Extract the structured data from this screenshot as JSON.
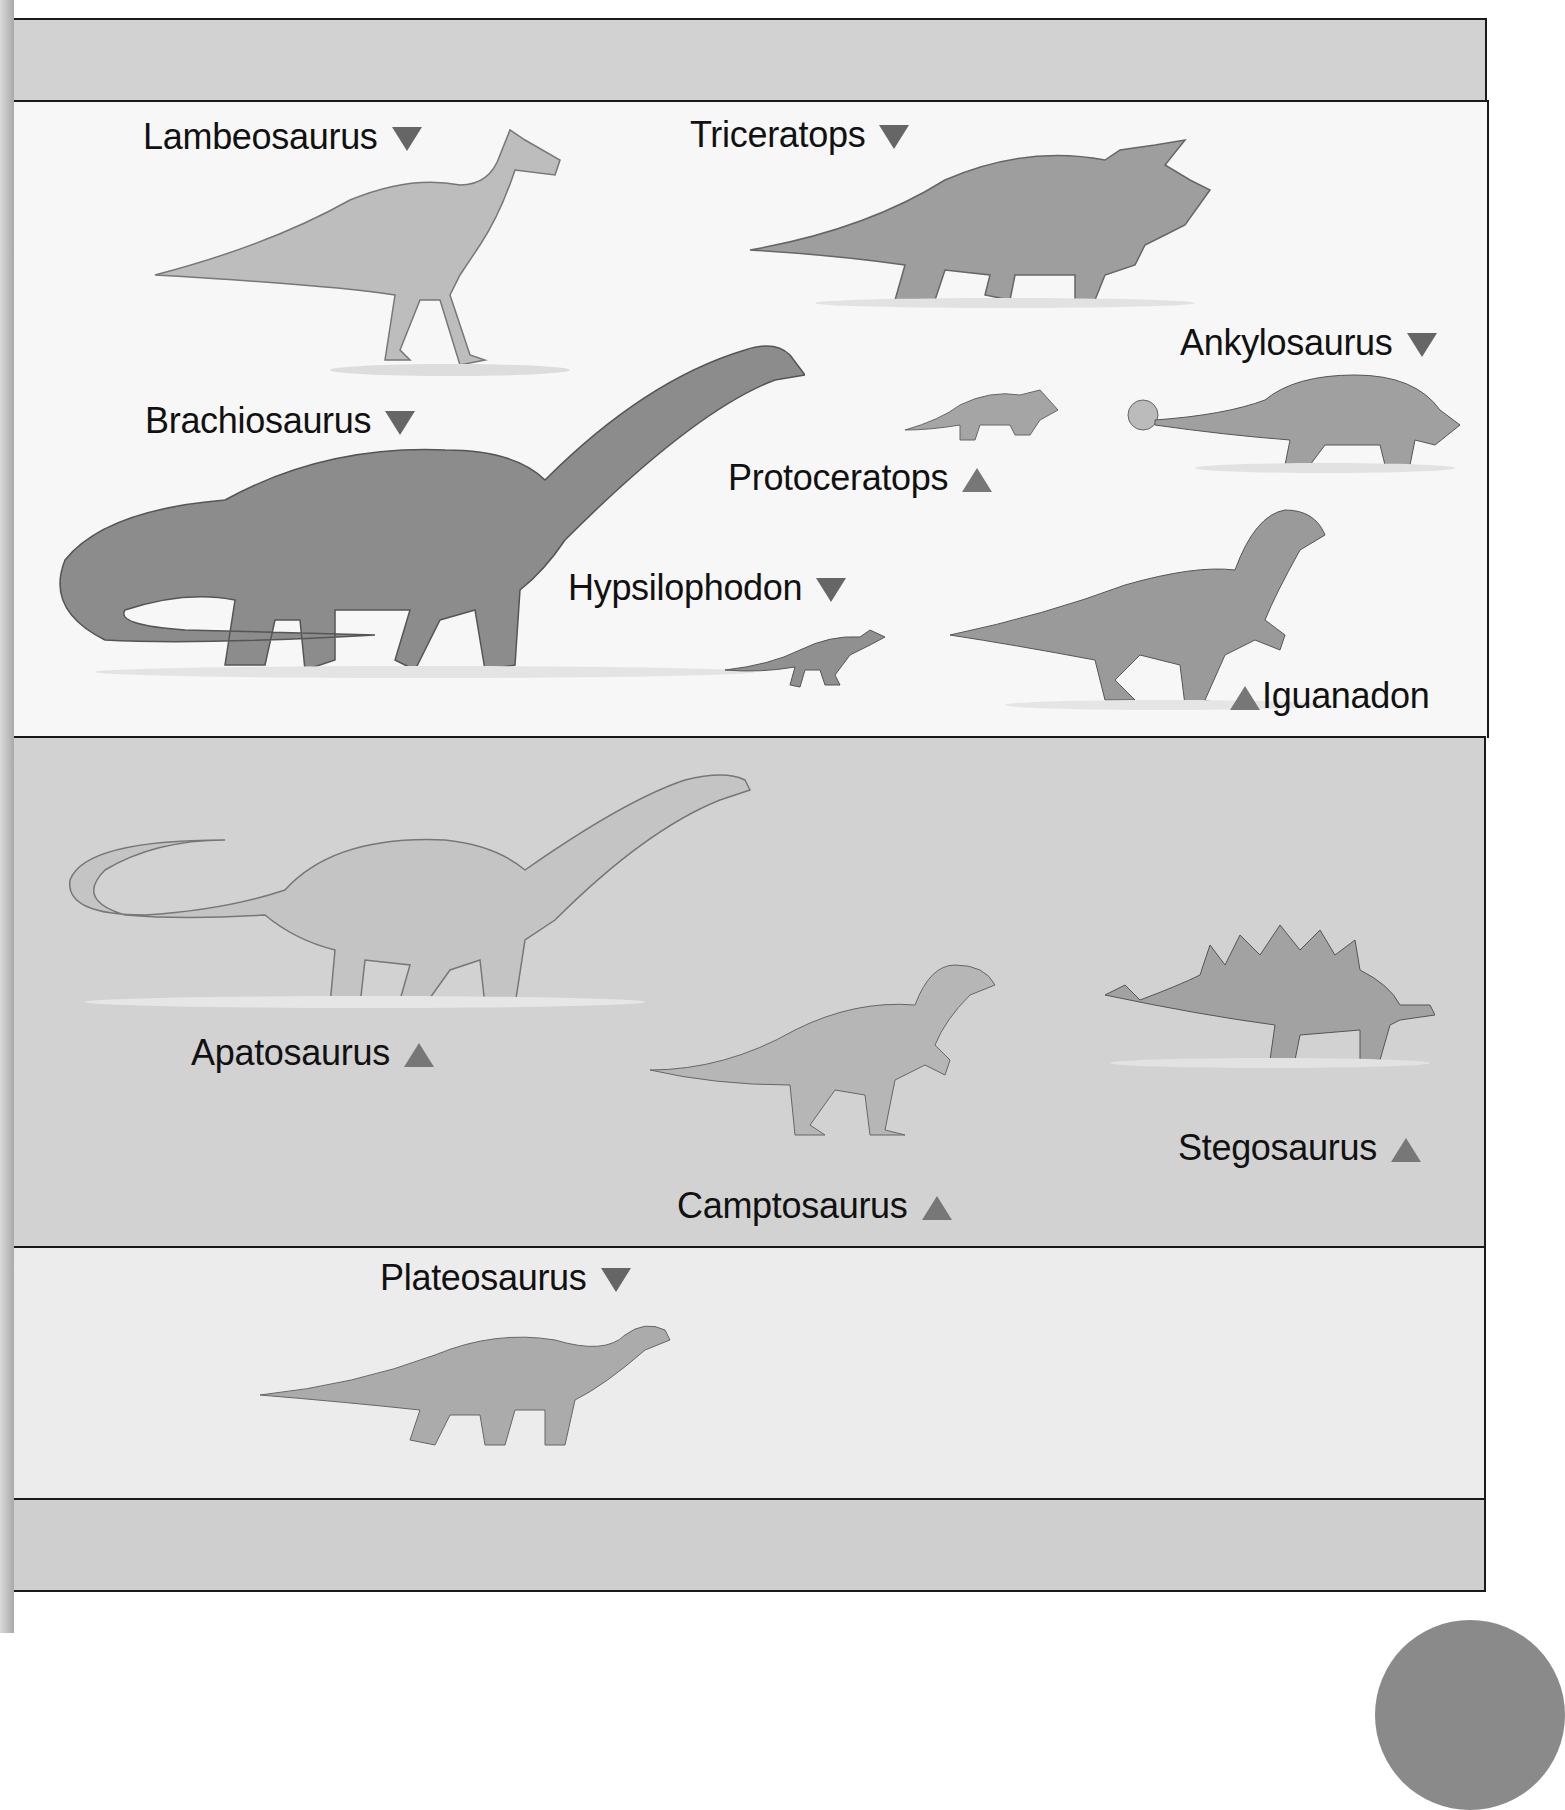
{
  "figure": {
    "bands": [
      {
        "name": "top-grey-band",
        "shade": "#d2d2d2"
      },
      {
        "name": "band-1",
        "shade": "#f7f7f7"
      },
      {
        "name": "band-2",
        "shade": "#cfcfcf"
      },
      {
        "name": "band-3",
        "shade": "#ececec"
      },
      {
        "name": "bottom-grey-band",
        "shade": "#cfcfcf"
      }
    ],
    "dinosaurs": [
      {
        "id": "lambeosaurus",
        "label": "Lambeosaurus",
        "marker": "down"
      },
      {
        "id": "triceratops",
        "label": "Triceratops",
        "marker": "down"
      },
      {
        "id": "ankylosaurus",
        "label": "Ankylosaurus",
        "marker": "down"
      },
      {
        "id": "brachiosaurus",
        "label": "Brachiosaurus",
        "marker": "down"
      },
      {
        "id": "protoceratops",
        "label": "Protoceratops",
        "marker": "up"
      },
      {
        "id": "hypsilophodon",
        "label": "Hypsilophodon",
        "marker": "down"
      },
      {
        "id": "iguanadon",
        "label": "Iguanadon",
        "marker": "up"
      },
      {
        "id": "apatosaurus",
        "label": "Apatosaurus",
        "marker": "up"
      },
      {
        "id": "camptosaurus",
        "label": "Camptosaurus",
        "marker": "up"
      },
      {
        "id": "stegosaurus",
        "label": "Stegosaurus",
        "marker": "up"
      },
      {
        "id": "plateosaurus",
        "label": "Plateosaurus",
        "marker": "down"
      }
    ],
    "marker_color": "#6b6b6b"
  }
}
